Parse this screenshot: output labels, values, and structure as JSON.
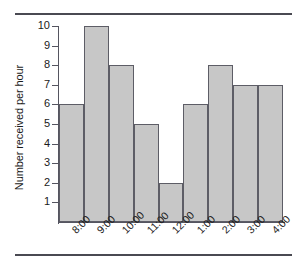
{
  "chart_data": {
    "type": "bar",
    "title": "",
    "subtitle": "",
    "xlabel": "",
    "ylabel": "Number received per hour",
    "categories": [
      "8:00",
      "9:00",
      "10:00",
      "11:00",
      "12:00",
      "1:00",
      "2:00",
      "3:00",
      "4:00"
    ],
    "values": [
      6,
      10,
      8,
      5,
      2,
      6,
      8,
      7,
      7
    ],
    "ylim": [
      0,
      10
    ],
    "yticks": [
      1,
      2,
      3,
      4,
      5,
      6,
      7,
      8,
      9,
      10
    ],
    "ytick_labels": [
      "1",
      "2",
      "3",
      "4",
      "5",
      "6",
      "7",
      "8",
      "9",
      "10"
    ],
    "grid": false,
    "legend": null,
    "bar_fill_color": "#c7c7c7",
    "bar_edge_color": "#5d5d66",
    "axis_color": "#555560",
    "background_color": "#ffffff",
    "xtick_label_rotation": -45,
    "bars_adjacent": true,
    "annotations": []
  }
}
